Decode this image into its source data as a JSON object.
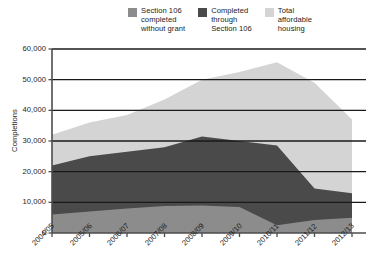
{
  "chart_data": {
    "type": "area",
    "stacked": true,
    "title": "",
    "subtitle": "",
    "xlabel": "",
    "ylabel": "Completions",
    "categories": [
      "2004/05",
      "2005/06",
      "2006/07",
      "2007/08",
      "2008/09",
      "2009/10",
      "2010/11",
      "2011/12",
      "2012/13"
    ],
    "ylim": [
      0,
      60000
    ],
    "ytick_values": [
      0,
      10000,
      20000,
      30000,
      40000,
      50000,
      60000
    ],
    "ytick_labels": [
      "0",
      "10,000",
      "20,000",
      "30,000",
      "40,000",
      "50,000",
      "60,000"
    ],
    "grid": true,
    "grid_axis": "y",
    "legend_position": "top",
    "series": [
      {
        "name": "Section 106 completed without grant",
        "color": "#8c8c8c",
        "values": [
          6000,
          7000,
          8000,
          8800,
          9000,
          8500,
          2500,
          4200,
          5000
        ]
      },
      {
        "name": "Completed through Section 106",
        "color": "#4a4a4a",
        "values": [
          22000,
          25000,
          26500,
          28000,
          31500,
          30000,
          28500,
          14500,
          13000
        ]
      },
      {
        "name": "Total affordable housing",
        "color": "#d4d4d4",
        "values": [
          32000,
          36000,
          38500,
          43500,
          50000,
          52500,
          55700,
          49000,
          37000
        ]
      }
    ]
  },
  "legend": {
    "items": [
      {
        "label": "Section 106\ncompleted\nwithout grant",
        "color": "#8c8c8c"
      },
      {
        "label": "Completed\nthrough\nSection 106",
        "color": "#4a4a4a"
      },
      {
        "label": "Total\naffordable\nhousing",
        "color": "#d4d4d4"
      }
    ]
  }
}
